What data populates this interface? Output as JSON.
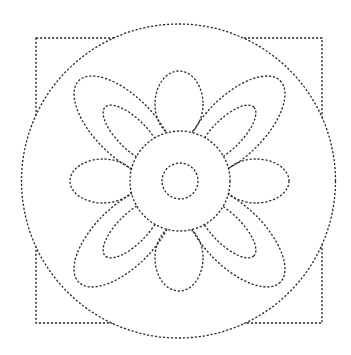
{
  "image": {
    "description": "Dotted-line tracing worksheet of a flower inside a circle over a square",
    "width": 351,
    "height": 355,
    "background": "#ffffff",
    "stroke_color": "#2a2a2a"
  },
  "shapes": {
    "square": {
      "x": 36,
      "y": 38,
      "width": 286,
      "height": 285
    },
    "outer_circle": {
      "cx": 178.5,
      "cy": 181,
      "r": 157
    },
    "center_circle": {
      "cx": 180,
      "cy": 181,
      "r": 50
    },
    "inner_circle": {
      "cx": 180,
      "cy": 181,
      "r": 18
    },
    "petals_cardinal": [
      {
        "name": "top",
        "cx": 179,
        "cy": 104,
        "rx": 24,
        "ry": 33,
        "rotate": 0
      },
      {
        "name": "bottom",
        "cx": 179,
        "cy": 258,
        "rx": 24,
        "ry": 33,
        "rotate": 0
      },
      {
        "name": "left",
        "cx": 103,
        "cy": 181,
        "rx": 33,
        "ry": 22,
        "rotate": 0
      },
      {
        "name": "right",
        "cx": 256,
        "cy": 181,
        "rx": 33,
        "ry": 22,
        "rotate": 0
      }
    ],
    "petals_diagonal_outer": [
      {
        "name": "top-left",
        "cx": 124,
        "cy": 126,
        "rx": 64,
        "ry": 30,
        "rotate": 45
      },
      {
        "name": "top-right",
        "cx": 235,
        "cy": 126,
        "rx": 64,
        "ry": 30,
        "rotate": -45
      },
      {
        "name": "bottom-left",
        "cx": 124,
        "cy": 237,
        "rx": 64,
        "ry": 30,
        "rotate": -45
      },
      {
        "name": "bottom-right",
        "cx": 235,
        "cy": 237,
        "rx": 64,
        "ry": 30,
        "rotate": 45
      }
    ],
    "petals_diagonal_inner": [
      {
        "name": "top-left",
        "cx": 132,
        "cy": 134,
        "rx": 38,
        "ry": 15,
        "rotate": 45
      },
      {
        "name": "top-right",
        "cx": 227,
        "cy": 134,
        "rx": 38,
        "ry": 15,
        "rotate": -45
      },
      {
        "name": "bottom-left",
        "cx": 132,
        "cy": 229,
        "rx": 38,
        "ry": 15,
        "rotate": -45
      },
      {
        "name": "bottom-right",
        "cx": 227,
        "cy": 229,
        "rx": 38,
        "ry": 15,
        "rotate": 45
      }
    ]
  }
}
